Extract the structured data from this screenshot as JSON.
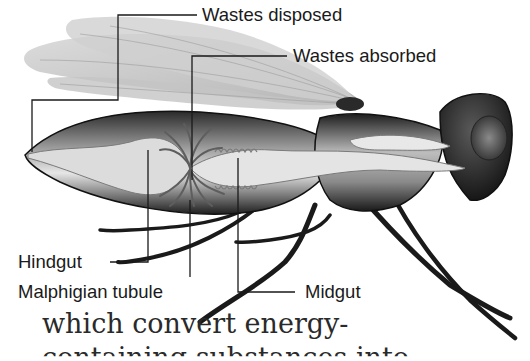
{
  "figure": {
    "labels": {
      "wastes_disposed": "Wastes disposed",
      "wastes_absorbed": "Wastes absorbed",
      "hindgut": "Hindgut",
      "malphigian_tubule": "Malphigian tubule",
      "midgut": "Midgut"
    }
  },
  "body_text": {
    "line1": "which convert energy-",
    "line2": "containing substances into"
  },
  "colors": {
    "ink": "#1a1a1a",
    "wing": "#c9c9c9",
    "body_dark": "#2b2b2b",
    "gut": "#d9d9d9",
    "tubule": "#6e6e6e",
    "background": "#ffffff"
  }
}
